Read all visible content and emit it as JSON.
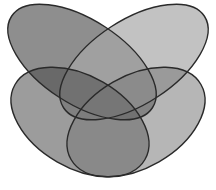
{
  "diagram": {
    "type": "venn",
    "set_count": 4,
    "labels_visible": false,
    "background": "#ffffff",
    "stroke_color": "#2a2a2a",
    "sets": [
      {
        "id": "A",
        "position": "top-left",
        "fill": "#5e5e5e",
        "opacity": 0.7,
        "cx": 82,
        "cy": 62,
        "rx": 84,
        "ry": 42,
        "rotate": 33
      },
      {
        "id": "B",
        "position": "top-right",
        "fill": "#a8a8a8",
        "opacity": 0.7,
        "cx": 134,
        "cy": 62,
        "rx": 84,
        "ry": 42,
        "rotate": -33
      },
      {
        "id": "C",
        "position": "bottom-left",
        "fill": "#4a4a4a",
        "opacity": 0.55,
        "cx": 80,
        "cy": 122,
        "rx": 75,
        "ry": 46,
        "rotate": 30
      },
      {
        "id": "D",
        "position": "bottom-right",
        "fill": "#7a7a7a",
        "opacity": 0.55,
        "cx": 136,
        "cy": 122,
        "rx": 75,
        "ry": 46,
        "rotate": -30
      }
    ]
  }
}
